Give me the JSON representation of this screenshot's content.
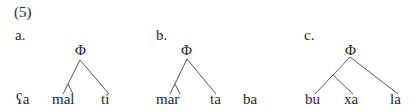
{
  "example_number": "(5)",
  "trees": [
    {
      "label": "a.",
      "root": "Φ",
      "leaves": [
        "ʕa",
        "mal",
        "ti"
      ]
    },
    {
      "label": "b.",
      "root": "Φ",
      "leaves": [
        "mar",
        "ta",
        "ba"
      ]
    },
    {
      "label": "c.",
      "root": "Φ",
      "leaves": [
        "bu",
        "xa",
        "la"
      ]
    }
  ]
}
